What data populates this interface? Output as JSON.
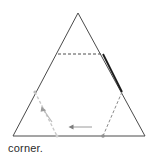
{
  "figure": {
    "kind": "geometry-diagram",
    "background_color": "#ffffff",
    "stroke_color": "#4a4a4a",
    "bold_stroke_color": "#1a1a1a",
    "dashed_stroke_color": "#555555",
    "guide_color": "#c9c9c9",
    "triangle": {
      "label": "outer-triangle",
      "apex": {
        "x": 78,
        "y": 13
      },
      "bottom_left": {
        "x": 13,
        "y": 136
      },
      "bottom_right": {
        "x": 145,
        "y": 136
      },
      "points": "78,13 13,136 145,136"
    },
    "hexagon": {
      "label": "inscribed-hexagon",
      "points": "58,54 103,54 122,92 103,136 57,136 35,92"
    },
    "hexagon_top_edge": {
      "label": "hexagon-top-dashed-edge",
      "x1": 58,
      "y1": 54,
      "x2": 103,
      "y2": 54
    },
    "hexagon_upper_right_edge": {
      "label": "hexagon-upper-right-bold-edge",
      "x1": 103,
      "y1": 54,
      "x2": 122,
      "y2": 92
    },
    "hexagon_lower_right_edge": {
      "label": "hexagon-lower-right-dashed-edge",
      "x1": 122,
      "y1": 92,
      "x2": 103,
      "y2": 136
    },
    "hexagon_lower_left_edge": {
      "label": "hexagon-lower-left-guide-edge",
      "x1": 35,
      "y1": 92,
      "x2": 57,
      "y2": 136
    },
    "fold_arrow_left": {
      "label": "fold-arrow-left-corner",
      "from": {
        "x": 52,
        "y": 122
      },
      "to": {
        "x": 42,
        "y": 108
      }
    },
    "fold_arrow_bottom": {
      "label": "fold-arrow-bottom-right-corner",
      "from": {
        "x": 92,
        "y": 127
      },
      "to": {
        "x": 70,
        "y": 127
      }
    },
    "vertex_dots": [
      {
        "label": "hexagon-left-vertex-dot",
        "x": 35,
        "y": 92
      },
      {
        "label": "hexagon-bottom-left-vertex-dot",
        "x": 57,
        "y": 136
      },
      {
        "label": "hexagon-bottom-right-vertex-dot",
        "x": 103,
        "y": 136
      }
    ]
  },
  "caption": {
    "text": "corner."
  }
}
